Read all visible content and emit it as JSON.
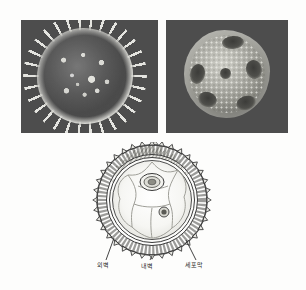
{
  "figure": {
    "caption": "",
    "background_color": "#fdfdfc"
  },
  "micrographs": {
    "background_color": "#4d4d4d",
    "panels": [
      {
        "name": "left-micrograph",
        "subject": "echinate pollen grain",
        "description": "spiny (echinate) pollen grain, scanning electron micrograph",
        "alt": ""
      },
      {
        "name": "right-micrograph",
        "subject": "porate pollen grain",
        "description": "rounded pollen grain with germinal pores and granular surface",
        "alt": ""
      }
    ]
  },
  "diagram": {
    "name": "pollen-grain-cross-section",
    "title": "",
    "labels": [
      {
        "id": "exine",
        "text": "외벽"
      },
      {
        "id": "intine",
        "text": "내벽"
      },
      {
        "id": "plasma",
        "text": "세포막"
      }
    ],
    "structures": {
      "outer_wall_icon": "spiky-outer-wall",
      "inner_wall_icon": "inner-wall-ring",
      "plasma_membrane_icon": "plasma-membrane-ring",
      "vegetative_nucleus_icon": "large-nucleus",
      "generative_nucleus_icon": "small-nucleus",
      "cytoplasm_icon": "vacuolated-cytoplasm"
    },
    "line_color": "#3a3a3a",
    "fill_color": "#f4f4f1"
  }
}
